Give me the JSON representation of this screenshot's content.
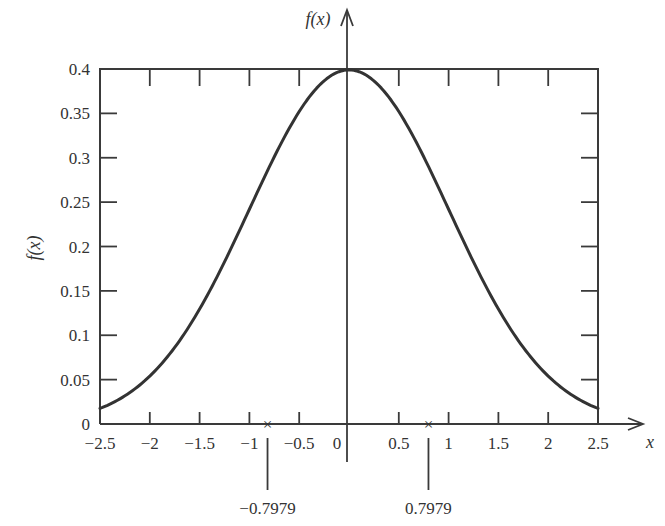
{
  "chart_data": {
    "type": "line",
    "title": "",
    "xlabel": "x",
    "ylabel": "f(x)",
    "top_axis_label": "f(x)",
    "function": "standard normal density f(x) = (1/sqrt(2*pi)) * exp(-x^2/2)",
    "xlim": [
      -2.5,
      2.5
    ],
    "ylim": [
      0,
      0.4
    ],
    "grid": false,
    "legend": null,
    "x_ticks": [
      -2.5,
      -2,
      -1.5,
      -1,
      -0.5,
      0,
      0.5,
      1,
      1.5,
      2,
      2.5
    ],
    "x_tick_labels": [
      "−2.5",
      "−2",
      "−1.5",
      "−1",
      "−0.5",
      "0",
      "0.5",
      "1",
      "1.5",
      "2",
      "2.5"
    ],
    "y_ticks": [
      0,
      0.05,
      0.1,
      0.15,
      0.2,
      0.25,
      0.3,
      0.35,
      0.4
    ],
    "y_tick_labels": [
      "0",
      "0.05",
      "0.1",
      "0.15",
      "0.2",
      "0.25",
      "0.3",
      "0.35",
      "0.4"
    ],
    "series": [
      {
        "name": "f(x)",
        "x": [
          -2.5,
          -2.25,
          -2,
          -1.75,
          -1.5,
          -1.25,
          -1,
          -0.75,
          -0.5,
          -0.25,
          0,
          0.25,
          0.5,
          0.75,
          1,
          1.25,
          1.5,
          1.75,
          2,
          2.25,
          2.5
        ],
        "values": [
          0.0175,
          0.0317,
          0.054,
          0.0863,
          0.1295,
          0.1826,
          0.242,
          0.3011,
          0.3521,
          0.3867,
          0.3989,
          0.3867,
          0.3521,
          0.3011,
          0.242,
          0.1826,
          0.1295,
          0.0863,
          0.054,
          0.0317,
          0.0175
        ]
      }
    ],
    "annotations": [
      {
        "x": -0.7979,
        "label": "−0.7979",
        "marker": "×"
      },
      {
        "x": 0.7979,
        "label": "0.7979",
        "marker": "×"
      }
    ]
  },
  "colors": {
    "ink": "#333333",
    "background": "#ffffff"
  }
}
